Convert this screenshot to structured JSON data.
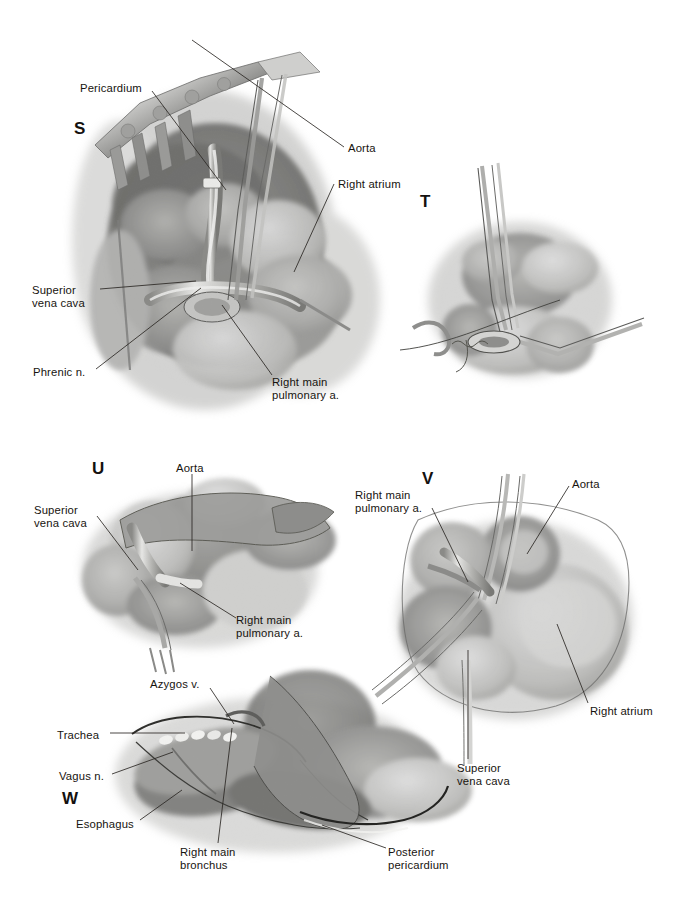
{
  "plate": {
    "width": 683,
    "height": 924,
    "background": "#ffffff",
    "ink": "#17140f",
    "leader_color": "#2b2723",
    "style": "grayscale watercolor wash medical illustration"
  },
  "panels": [
    {
      "letter": "S",
      "letter_x": 74,
      "letter_y": 120,
      "subject": "Right thoracotomy exposure with rib retractor; pericardium opened anterior to phrenic nerve exposing superior vena cava, aorta, right atrium and right main pulmonary artery",
      "annotations": [
        {
          "name": "pericardium",
          "text": "Pericardium",
          "x": 80,
          "y": 82,
          "align": "left",
          "leader": [
            [
              152,
              91
            ],
            [
              226,
              190
            ]
          ]
        },
        {
          "name": "aorta",
          "text": "Aorta",
          "x": 348,
          "y": 142,
          "align": "left",
          "leader": [
            [
              344,
              147
            ],
            [
              192,
              40
            ]
          ]
        },
        {
          "name": "right-atrium",
          "text": "Right atrium",
          "x": 338,
          "y": 178,
          "align": "left",
          "leader": [
            [
              334,
              184
            ],
            [
              294,
              272
            ]
          ]
        },
        {
          "name": "superior-vena-cava",
          "text": "Superior\nvena cava",
          "x": 32,
          "y": 284,
          "align": "left",
          "leader": [
            [
              100,
              289
            ],
            [
              196,
              281
            ]
          ]
        },
        {
          "name": "phrenic-nerve",
          "text": "Phrenic n.",
          "x": 33,
          "y": 366,
          "align": "left",
          "leader": [
            [
              96,
              369
            ],
            [
              201,
              288
            ]
          ]
        },
        {
          "name": "right-main-pulmonary-artery",
          "text": "Right main\npulmonary a.",
          "x": 272,
          "y": 376,
          "align": "left",
          "leader": [
            [
              272,
              375
            ],
            [
              222,
              305
            ]
          ]
        }
      ]
    },
    {
      "letter": "T",
      "letter_x": 420,
      "letter_y": 193,
      "subject": "Close-up of vascular clamp and ligature being placed on the right main pulmonary artery within the pericardium",
      "annotations": []
    },
    {
      "letter": "U",
      "letter_x": 92,
      "letter_y": 460,
      "subject": "Intrapericardial view of divided right main pulmonary artery stump with aorta and superior vena cava",
      "annotations": [
        {
          "name": "aorta",
          "text": "Aorta",
          "x": 176,
          "y": 462,
          "align": "left",
          "leader": [
            [
              192,
              474
            ],
            [
              192,
              551
            ]
          ]
        },
        {
          "name": "superior-vena-cava",
          "text": "Superior\nvena cava",
          "x": 34,
          "y": 504,
          "align": "left",
          "leader": [
            [
              97,
              516
            ],
            [
              138,
              570
            ]
          ]
        },
        {
          "name": "right-main-pulmonary-artery",
          "text": "Right main\npulmonary a.",
          "x": 236,
          "y": 614,
          "align": "left",
          "leader": [
            [
              236,
              618
            ],
            [
              180,
              583
            ]
          ]
        }
      ]
    },
    {
      "letter": "V",
      "letter_x": 422,
      "letter_y": 470,
      "subject": "Anterior view of the heart and great vessels after division of the right main pulmonary artery, showing aorta, right atrium and superior vena cava",
      "annotations": [
        {
          "name": "right-main-pulmonary-artery",
          "text": "Right main\npulmonary a.",
          "x": 355,
          "y": 489,
          "align": "left",
          "leader": [
            [
              432,
              508
            ],
            [
              468,
              582
            ]
          ]
        },
        {
          "name": "aorta",
          "text": "Aorta",
          "x": 572,
          "y": 478,
          "align": "left",
          "leader": [
            [
              569,
              486
            ],
            [
              527,
              554
            ]
          ]
        },
        {
          "name": "right-atrium",
          "text": "Right atrium",
          "x": 590,
          "y": 705,
          "align": "left",
          "leader": [
            [
              588,
              703
            ],
            [
              557,
              624
            ]
          ]
        },
        {
          "name": "superior-vena-cava",
          "text": "Superior\nvena cava",
          "x": 457,
          "y": 762,
          "align": "left",
          "leader": [
            [
              468,
              759
            ],
            [
              468,
              650
            ]
          ]
        }
      ]
    },
    {
      "letter": "W",
      "letter_x": 62,
      "letter_y": 790,
      "subject": "Posterior mediastinal view showing trachea, right main bronchus, esophagus, vagus nerve, azygos vein and posterior pericardium",
      "annotations": [
        {
          "name": "azygos-vein",
          "text": "Azygos v.",
          "x": 150,
          "y": 678,
          "align": "left",
          "leader": [
            [
              210,
              688
            ],
            [
              234,
              724
            ]
          ]
        },
        {
          "name": "trachea",
          "text": "Trachea",
          "x": 57,
          "y": 729,
          "align": "left",
          "leader": [
            [
              110,
              733
            ],
            [
              185,
              733
            ]
          ]
        },
        {
          "name": "vagus-nerve",
          "text": "Vagus n.",
          "x": 59,
          "y": 770,
          "align": "left",
          "leader": [
            [
              112,
              774
            ],
            [
              173,
              752
            ]
          ]
        },
        {
          "name": "esophagus",
          "text": "Esophagus",
          "x": 76,
          "y": 818,
          "align": "left",
          "leader": [
            [
              140,
              820
            ],
            [
              182,
              790
            ]
          ]
        },
        {
          "name": "right-main-bronchus",
          "text": "Right main\nbronchus",
          "x": 180,
          "y": 846,
          "align": "left",
          "leader": [
            [
              218,
              843
            ],
            [
              232,
              728
            ]
          ]
        },
        {
          "name": "posterior-pericardium",
          "text": "Posterior\npericardium",
          "x": 388,
          "y": 846,
          "align": "left",
          "leader": [
            [
              386,
              848
            ],
            [
              322,
              825
            ]
          ]
        }
      ]
    }
  ],
  "all_labels": [
    "Pericardium",
    "Aorta",
    "Right atrium",
    "Superior vena cava",
    "Phrenic n.",
    "Right main pulmonary a.",
    "Azygos v.",
    "Trachea",
    "Vagus n.",
    "Esophagus",
    "Right main bronchus",
    "Posterior pericardium"
  ],
  "panel_letters": [
    "S",
    "T",
    "U",
    "V",
    "W"
  ]
}
